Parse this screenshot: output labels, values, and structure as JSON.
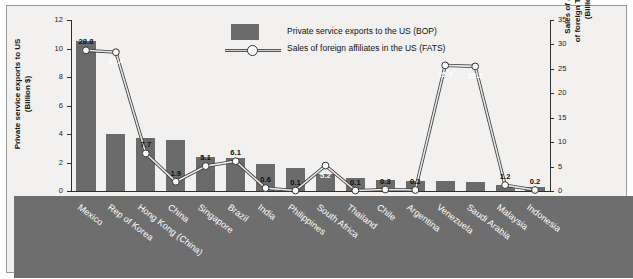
{
  "chart_data": {
    "type": "bar",
    "title": "",
    "subtitle": "",
    "xlabel": "",
    "ylabel": "Private service exports to US\n(Billion $)",
    "y2label": "Sales of affiliates\nof foreign TNCs in US\n(Billion $)",
    "ylim": [
      0,
      12
    ],
    "y2lim": [
      0,
      35
    ],
    "yticks": [
      "0",
      "2",
      "4",
      "6",
      "8",
      "10",
      "12"
    ],
    "y2ticks": [
      "0",
      "5",
      "10",
      "15",
      "20",
      "25",
      "30",
      "35"
    ],
    "grid": false,
    "legend_position": "top-center",
    "categories": [
      "Mexico",
      "Rep of Korea",
      "Hong Kong (China)",
      "China",
      "Singapore",
      "Brazil",
      "India",
      "Philippines",
      "South Africa",
      "Thailand",
      "Chile",
      "Argentina",
      "Venezuela",
      "Saudi Arabia",
      "Malaysia",
      "Indonesia"
    ],
    "series": [
      {
        "name": "Private service exports to the US (BOP)",
        "type": "bar",
        "axis": "left",
        "color": "#6b6b6b",
        "values": [
          10.5,
          4.0,
          3.7,
          3.6,
          2.4,
          2.3,
          1.9,
          1.6,
          1.2,
          0.9,
          0.8,
          0.7,
          0.7,
          0.6,
          0.4,
          0.3
        ]
      },
      {
        "name": "Sales of foreign affiliates in the US (FATS)",
        "type": "line",
        "axis": "right",
        "color": "#ffffff",
        "values": [
          28.8,
          28.4,
          7.7,
          1.9,
          5.1,
          6.1,
          0.6,
          0.1,
          5.2,
          0.1,
          0.3,
          0.2,
          25.7,
          25.5,
          1.2,
          0.2
        ],
        "labels": [
          "28.8",
          "28.4",
          "7.7",
          "1.9",
          "5.1",
          "6.1",
          "0.6",
          "0.1",
          "5.2",
          "0.1",
          "0.3",
          "0.2",
          "25.7",
          "25.5",
          "1.2",
          "0.2"
        ]
      }
    ]
  },
  "legend": {
    "bar_label": "Private service exports to the US (BOP)",
    "line_label": "Sales of foreign affiliates in the US (FATS)"
  },
  "axes": {
    "left_title": "Private service exports to US\n(Billion $)",
    "right_title": "Sales of affiliates\nof foreign TNCs in US\n(Billion $)"
  }
}
